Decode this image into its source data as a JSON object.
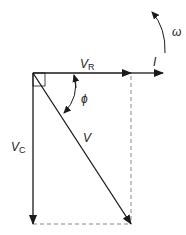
{
  "diagram": {
    "type": "phasor-diagram",
    "labels": {
      "vr_main": "V",
      "vr_sub": "R",
      "i": "I",
      "omega": "ω",
      "phi": "ϕ",
      "v": "V",
      "vc_main": "V",
      "vc_sub": "C"
    },
    "colors": {
      "stroke": "#1a1a1a",
      "dashed": "#888888",
      "background": "#ffffff"
    }
  }
}
